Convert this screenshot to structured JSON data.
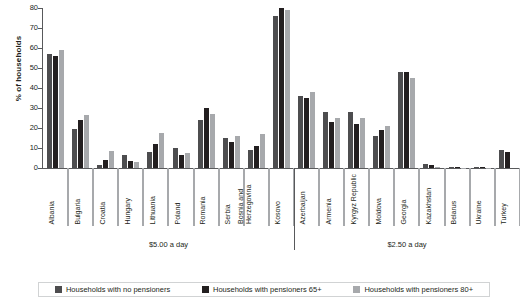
{
  "chart_data": {
    "type": "bar",
    "title": "",
    "xlabel": "",
    "ylabel": "% of households",
    "ylim": [
      0,
      80
    ],
    "yticks": [
      0,
      10,
      20,
      30,
      40,
      50,
      60,
      70,
      80
    ],
    "grid": false,
    "legend_position": "bottom",
    "categories": [
      "Albania",
      "Bulgaria",
      "Croatia",
      "Hungary",
      "Lithuania",
      "Poland",
      "Romania",
      "Serbia",
      "Bosnia and Herzegovina",
      "Kosovo",
      "Azerbaijan",
      "Armenia",
      "Kyrgyz Republic",
      "Moldova",
      "Georgia",
      "Kazakhstan",
      "Belarus",
      "Ukraine",
      "Turkey"
    ],
    "series": [
      {
        "name": "Households with no pensioners",
        "color": "#4d4d4f",
        "values": [
          57,
          19.5,
          1.5,
          6.5,
          8,
          10,
          24,
          15,
          9,
          76,
          36,
          28,
          28,
          16,
          48,
          2,
          0.3,
          0.3,
          9
        ]
      },
      {
        "name": "Households with pensioners 65+",
        "color": "#231f20",
        "values": [
          56,
          24,
          4,
          3.5,
          12,
          6.5,
          30,
          13,
          11,
          80,
          35,
          23,
          22,
          19,
          48,
          1.5,
          0.3,
          0.3,
          8
        ]
      },
      {
        "name": "Households with pensioners 80+",
        "color": "#a7a9ac",
        "values": [
          59,
          26.5,
          8.5,
          3,
          17.5,
          7.5,
          27,
          16,
          17,
          79,
          38,
          25,
          25,
          21,
          45,
          0.5,
          0.2,
          0.2,
          0
        ]
      }
    ],
    "groups": [
      {
        "label": "$5.00 a day",
        "start": 0,
        "end": 9
      },
      {
        "label": "$2.50 a day",
        "start": 10,
        "end": 18
      }
    ]
  },
  "legend": {
    "items": [
      {
        "label": "Households with no pensioners",
        "color": "#4d4d4f"
      },
      {
        "label": "Households with pensioners 65+",
        "color": "#231f20"
      },
      {
        "label": "Households with pensioners 80+",
        "color": "#a7a9ac"
      }
    ]
  }
}
